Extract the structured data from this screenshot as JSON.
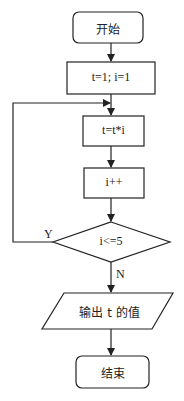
{
  "flowchart": {
    "nodes": [
      {
        "id": "start",
        "shape": "terminal",
        "label": "开始"
      },
      {
        "id": "init",
        "shape": "process",
        "label": "t=1; i=1"
      },
      {
        "id": "mult",
        "shape": "process",
        "label": "t=t*i"
      },
      {
        "id": "incr",
        "shape": "process",
        "label": "i++"
      },
      {
        "id": "cond",
        "shape": "decision",
        "label": "i<=5"
      },
      {
        "id": "output",
        "shape": "io",
        "label": "输出 t 的值"
      },
      {
        "id": "end",
        "shape": "terminal",
        "label": "结束"
      }
    ],
    "edges": [
      {
        "from": "start",
        "to": "init",
        "label": ""
      },
      {
        "from": "init",
        "to": "mult",
        "label": ""
      },
      {
        "from": "mult",
        "to": "incr",
        "label": ""
      },
      {
        "from": "incr",
        "to": "cond",
        "label": ""
      },
      {
        "from": "cond",
        "to": "mult",
        "label": "Y"
      },
      {
        "from": "cond",
        "to": "output",
        "label": "N"
      },
      {
        "from": "output",
        "to": "end",
        "label": ""
      }
    ],
    "branch_labels": {
      "yes": "Y",
      "no": "N"
    },
    "colors": {
      "stroke": "#222222",
      "background": "#ffffff"
    }
  }
}
